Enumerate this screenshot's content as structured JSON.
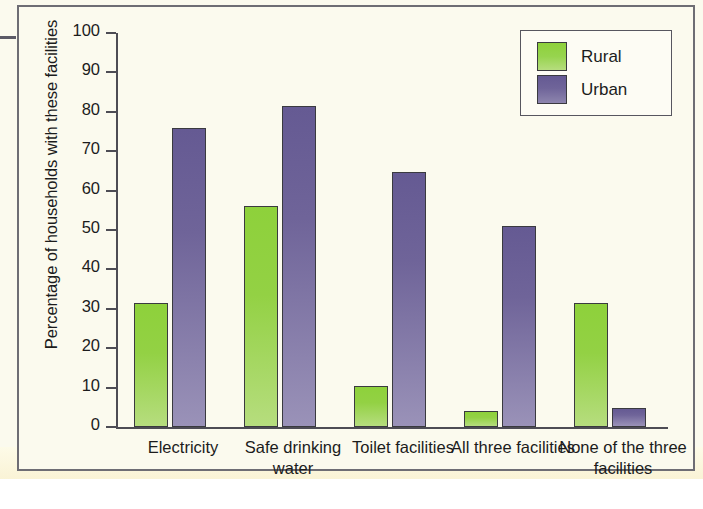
{
  "figure": {
    "background_color": "#fbfaee",
    "border_color": "#6e6d74"
  },
  "legend": {
    "position": "top-right",
    "entries": [
      {
        "label": "Rural",
        "color": "#8ece38",
        "swatch_name": "legend-swatch-rural"
      },
      {
        "label": "Urban",
        "color": "#6b5f99",
        "swatch_name": "legend-swatch-urban"
      }
    ]
  },
  "chart_data": {
    "type": "bar",
    "title": "",
    "xlabel": "",
    "ylabel": "Percentage of households with these facilities",
    "ylim": [
      0,
      100
    ],
    "ytick_labels": [
      "0",
      "10",
      "20",
      "30",
      "40",
      "50",
      "60",
      "70",
      "80",
      "90",
      "100"
    ],
    "ytick_values": [
      0,
      10,
      20,
      30,
      40,
      50,
      60,
      70,
      80,
      90,
      100
    ],
    "grid": false,
    "legend_position": "top-right",
    "categories": [
      "Electricity",
      "Safe drinking water",
      "Toilet facilities",
      "All three facilities",
      "None of the three facilities"
    ],
    "series": [
      {
        "name": "Rural",
        "color": "#8ece38",
        "values": [
          31.5,
          56,
          10.3,
          4.1,
          31.5
        ]
      },
      {
        "name": "Urban",
        "color": "#6b5f99",
        "values": [
          75.8,
          81.5,
          64.7,
          51,
          4.9
        ]
      }
    ]
  }
}
